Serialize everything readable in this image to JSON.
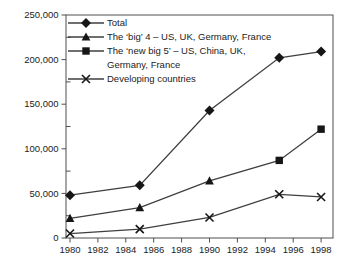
{
  "chart_data": {
    "type": "line",
    "title": "",
    "xlabel": "",
    "ylabel": "",
    "grid": false,
    "legend_position": "top-left-inside",
    "x_axis": {
      "values": [
        1980,
        1982,
        1984,
        1986,
        1988,
        1990,
        1992,
        1994,
        1996,
        1998
      ],
      "tick_labels": [
        "1980",
        "1982",
        "1984",
        "1986",
        "1988",
        "1990",
        "1992",
        "1994",
        "1996",
        "1998"
      ],
      "range": [
        1979.7,
        1998.9
      ]
    },
    "y_axis": {
      "values": [
        0,
        50000,
        100000,
        150000,
        200000,
        250000
      ],
      "tick_labels": [
        "0",
        "50,000",
        "100,000",
        "150,000",
        "200,000",
        "250,000"
      ],
      "minor_tick_step": 25000,
      "range": [
        0,
        250000
      ]
    },
    "series": [
      {
        "name": "Total",
        "marker": "diamond",
        "x": [
          1980,
          1985,
          1990,
          1995,
          1998
        ],
        "y": [
          48000,
          59000,
          143000,
          202000,
          209000
        ]
      },
      {
        "name": "The ‘big’ 4 – US, UK, Germany, France",
        "marker": "triangle",
        "x": [
          1980,
          1985,
          1990
        ],
        "y": [
          22000,
          34000,
          64000
        ]
      },
      {
        "name": "The ‘new big 5’ – US, China, UK, Germany, France",
        "marker": "square",
        "x": [
          1995,
          1998
        ],
        "y": [
          87000,
          122000
        ],
        "connect_from_series": 1
      },
      {
        "name": "Developing countries",
        "marker": "x",
        "x": [
          1980,
          1985,
          1990,
          1995,
          1998
        ],
        "y": [
          5000,
          10000,
          23000,
          49000,
          46000
        ]
      }
    ],
    "legend": {
      "entries": [
        {
          "series": 0,
          "marker": "diamond",
          "lines": [
            "Total"
          ]
        },
        {
          "series": 1,
          "marker": "triangle",
          "lines": [
            "The ‘big’ 4 – US, UK, Germany, France"
          ]
        },
        {
          "series": 2,
          "marker": "square",
          "lines": [
            "The ‘new big 5’ – US, China, UK,",
            "Germany, France"
          ]
        },
        {
          "series": 3,
          "marker": "x",
          "lines": [
            "Developing countries"
          ]
        }
      ]
    },
    "colors": {
      "line": "#3f3f3f",
      "marker": "#161616",
      "axis": "#4f4f4f",
      "text": "#222222",
      "background": "#ffffff"
    }
  }
}
